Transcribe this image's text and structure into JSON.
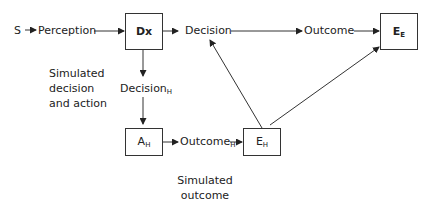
{
  "diagram": {
    "nodes": {
      "stimulus": "S",
      "perception": "Perception",
      "dx_box": "Dx",
      "decision": "Decision",
      "outcome": "Outcome",
      "ee_box_main": "E",
      "ee_box_sub": "E",
      "decision_h_main": "Decision",
      "decision_h_sub": "H",
      "ah_box_main": "A",
      "ah_box_sub": "H",
      "outcome_h_main": "Outcome",
      "outcome_h_sub": "H",
      "eh_box_main": "E",
      "eh_box_sub": "H"
    },
    "notes": {
      "simulated_decision_line1": "Simulated",
      "simulated_decision_line2": "decision",
      "simulated_decision_line3": "and action",
      "simulated_outcome_line1": "Simulated outcome",
      "simulated_outcome_line2": "and evaluation"
    },
    "edges": [
      {
        "from": "S",
        "to": "Perception"
      },
      {
        "from": "Perception",
        "to": "Dx"
      },
      {
        "from": "Dx",
        "to": "Decision"
      },
      {
        "from": "Decision",
        "to": "Outcome"
      },
      {
        "from": "Outcome",
        "to": "E_E"
      },
      {
        "from": "Dx",
        "to": "Decision_H"
      },
      {
        "from": "Decision_H",
        "to": "A_H"
      },
      {
        "from": "A_H",
        "to": "Outcome_H"
      },
      {
        "from": "Outcome_H",
        "to": "E_H"
      },
      {
        "from": "E_H",
        "to": "Decision"
      },
      {
        "from": "E_H",
        "to": "E_E"
      }
    ]
  }
}
